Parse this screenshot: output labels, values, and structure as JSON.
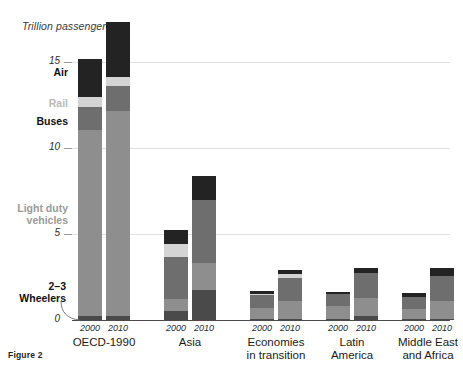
{
  "figure": {
    "caption": "Figure 2",
    "axis_title": "Trillion passenger-km"
  },
  "annotations": {
    "air": "Air",
    "rail": "Rail",
    "buses": "Buses",
    "light_duty_vehicles": "Light duty vehicles",
    "light_duty_vehicles_line1": "Light duty",
    "light_duty_vehicles_line2": "vehicles",
    "wheelers_line1": "2–3",
    "wheelers_line2": "Wheelers"
  },
  "colors": {
    "air": "#232323",
    "rail": "#d4d4d4",
    "buses": "#6e6e6e",
    "light_duty_vehicles": "#8e8e8e",
    "wheelers": "#4a4a4a",
    "gridline": "#e2e2e2",
    "baseline": "#4a4a4a",
    "background": "#ffffff"
  },
  "chart_data": {
    "type": "bar",
    "subtype": "stacked",
    "title": "",
    "xlabel": "",
    "ylabel": "Trillion passenger-km",
    "ylim": [
      0,
      17.5
    ],
    "yticks": [
      0,
      5,
      10,
      15
    ],
    "ytick_labels": [
      "0",
      "5",
      "10",
      "15"
    ],
    "grid": true,
    "legend_position": "left-annotations",
    "categories": [
      "OECD-1990",
      "Asia",
      "Economies in transition",
      "Latin America",
      "Middle East and Africa"
    ],
    "category_lines": [
      [
        "OECD-1990"
      ],
      [
        "Asia"
      ],
      [
        "Economies",
        "in transition"
      ],
      [
        "Latin",
        "America"
      ],
      [
        "Middle East",
        "and Africa"
      ]
    ],
    "years": [
      "2000",
      "2010"
    ],
    "stack_order": [
      "2-3 Wheelers",
      "Light duty vehicles",
      "Buses",
      "Rail",
      "Air"
    ],
    "series": [
      {
        "name": "2-3 Wheelers",
        "color": "#4a4a4a",
        "values": [
          [
            0.25,
            0.25
          ],
          [
            0.55,
            1.75
          ],
          [
            0.05,
            0.05
          ],
          [
            0.05,
            0.25
          ],
          [
            0.05,
            0.05
          ]
        ]
      },
      {
        "name": "Light duty vehicles",
        "color": "#8e8e8e",
        "values": [
          [
            10.8,
            11.9
          ],
          [
            0.65,
            1.55
          ],
          [
            0.65,
            1.05
          ],
          [
            0.75,
            1.05
          ],
          [
            0.6,
            1.05
          ]
        ]
      },
      {
        "name": "Buses",
        "color": "#6e6e6e",
        "values": [
          [
            1.35,
            1.45
          ],
          [
            2.45,
            3.7
          ],
          [
            0.75,
            1.35
          ],
          [
            0.7,
            1.45
          ],
          [
            0.7,
            1.45
          ]
        ]
      },
      {
        "name": "Rail",
        "color": "#d4d4d4",
        "values": [
          [
            0.55,
            0.55
          ],
          [
            0.75,
            0.0
          ],
          [
            0.05,
            0.2
          ],
          [
            0.0,
            0.0
          ],
          [
            0.0,
            0.0
          ]
        ]
      },
      {
        "name": "Air",
        "color": "#232323",
        "values": [
          [
            2.25,
            3.15
          ],
          [
            0.85,
            1.4
          ],
          [
            0.2,
            0.25
          ],
          [
            0.15,
            0.25
          ],
          [
            0.25,
            0.45
          ]
        ]
      }
    ],
    "totals": [
      [
        15.2,
        17.3
      ],
      [
        5.25,
        8.4
      ],
      [
        1.7,
        2.9
      ],
      [
        1.65,
        3.0
      ],
      [
        1.6,
        3.0
      ]
    ]
  }
}
